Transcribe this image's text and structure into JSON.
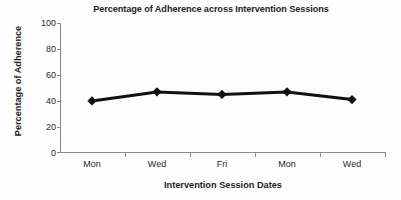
{
  "chart_data": {
    "type": "line",
    "title": "Percentage of Adherence across Intervention Sessions",
    "xlabel": "Intervention Session Dates",
    "ylabel": "Percentage of Adherence",
    "categories": [
      "Mon",
      "Wed",
      "Fri",
      "Mon",
      "Wed"
    ],
    "values": [
      40,
      47,
      45,
      47,
      41
    ],
    "series": [
      {
        "name": "Adherence",
        "values": [
          40,
          47,
          45,
          47,
          41
        ],
        "color": "#111111",
        "marker": "diamond",
        "line_width": 3
      }
    ],
    "ylim": [
      0,
      100
    ],
    "yticks": [
      0,
      20,
      40,
      60,
      80,
      100
    ],
    "ytick_labels": [
      "0",
      "20",
      "40",
      "60",
      "80",
      "100"
    ],
    "xtick_labels": [
      "Mon",
      "Wed",
      "Fri",
      "Mon",
      "Wed"
    ],
    "grid": false,
    "legend": false,
    "legend_position": "none",
    "axis_color": "#808080",
    "background": "#ffffff"
  }
}
